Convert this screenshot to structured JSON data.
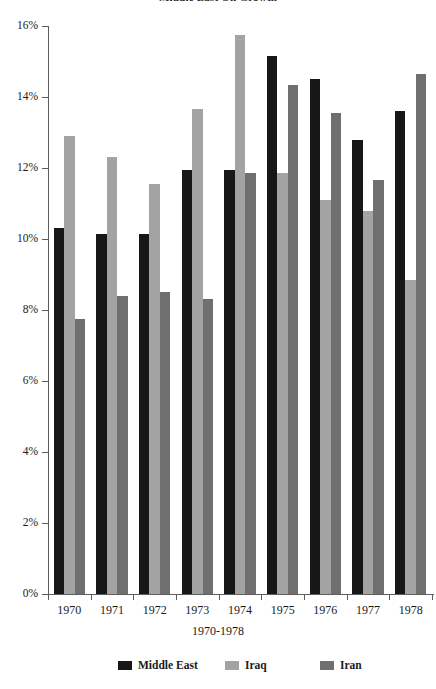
{
  "chart_data": {
    "type": "bar",
    "title": "Middle East Oil Growth",
    "subtitle": "",
    "xlabel": "1970-1978",
    "ylabel": "",
    "categories": [
      "1970",
      "1971",
      "1972",
      "1973",
      "1974",
      "1975",
      "1976",
      "1977",
      "1978"
    ],
    "series": [
      {
        "name": "Middle East",
        "color": "#171717",
        "values": [
          10.3,
          10.15,
          10.15,
          11.95,
          11.95,
          15.15,
          14.5,
          12.8,
          13.6
        ]
      },
      {
        "name": "Iraq",
        "color": "#a3a3a3",
        "values": [
          12.9,
          12.3,
          11.55,
          13.65,
          15.75,
          11.85,
          11.1,
          10.8,
          8.85
        ]
      },
      {
        "name": "Iran",
        "color": "#6f6f6f",
        "values": [
          7.75,
          8.4,
          8.5,
          8.3,
          11.85,
          14.35,
          13.55,
          11.65,
          14.65
        ]
      }
    ],
    "ylim": [
      0,
      16
    ],
    "yticks": [
      0,
      2,
      4,
      6,
      8,
      10,
      12,
      14,
      16
    ],
    "ytick_labels": [
      "0%",
      "2%",
      "4%",
      "6%",
      "8%",
      "10%",
      "12%",
      "14%",
      "16%"
    ],
    "value_unit": "%",
    "grid": false,
    "legend_position": "bottom",
    "legend": [
      "Middle East",
      "Iraq",
      "Iran"
    ]
  },
  "axis": {
    "y_axis_color": "#5d5d5d",
    "x_axis_color": "#5d5d5d"
  }
}
